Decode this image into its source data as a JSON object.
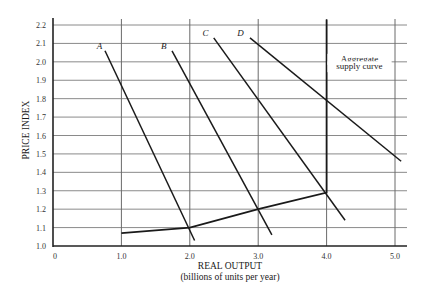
{
  "chart_data": {
    "type": "line",
    "title": "",
    "xlabel": "REAL OUTPUT",
    "xlabel_sub": "(billions of units per year)",
    "ylabel": "PRICE INDEX",
    "xlim": [
      0,
      5.0
    ],
    "ylim": [
      1.0,
      2.2
    ],
    "x_ticks": [
      0,
      1.0,
      2.0,
      3.0,
      4.0,
      5.0
    ],
    "x_tick_labels": [
      "0",
      "1.0",
      "2.0",
      "3.0",
      "4.0",
      "5.0"
    ],
    "y_ticks": [
      1.0,
      1.1,
      1.2,
      1.3,
      1.4,
      1.5,
      1.6,
      1.7,
      1.8,
      1.9,
      2.0,
      2.1,
      2.2
    ],
    "y_tick_labels": [
      "1.0",
      "1.1",
      "1.2",
      "1.3",
      "1.4",
      "1.5",
      "1.6",
      "1.7",
      "1.8",
      "1.9",
      "2.0",
      "2.1",
      "2.2"
    ],
    "grid": true,
    "legend": "none",
    "series": [
      {
        "name": "A",
        "kind": "aggregate demand",
        "x": [
          0.76,
          2.07
        ],
        "y": [
          2.06,
          1.03
        ],
        "label_pos": [
          0.68,
          2.07
        ]
      },
      {
        "name": "B",
        "kind": "aggregate demand",
        "x": [
          1.74,
          3.2
        ],
        "y": [
          2.06,
          1.06
        ],
        "label_pos": [
          1.62,
          2.07
        ]
      },
      {
        "name": "C",
        "kind": "aggregate demand",
        "x": [
          2.35,
          4.27
        ],
        "y": [
          2.13,
          1.14
        ],
        "label_pos": [
          2.23,
          2.14
        ]
      },
      {
        "name": "D",
        "kind": "aggregate demand",
        "x": [
          2.88,
          5.09
        ],
        "y": [
          2.13,
          1.46
        ],
        "label_pos": [
          2.74,
          2.14
        ]
      },
      {
        "name": "Aggregate supply curve",
        "kind": "aggregate supply",
        "x": [
          1.0,
          2.0,
          3.0,
          4.0,
          4.0
        ],
        "y": [
          1.07,
          1.1,
          1.2,
          1.29,
          2.23
        ]
      }
    ],
    "annotations": [
      {
        "text": "Aggregate",
        "x": 4.48,
        "y": 2.0
      },
      {
        "text": "supply curve",
        "x": 4.48,
        "y": 1.96
      }
    ]
  }
}
